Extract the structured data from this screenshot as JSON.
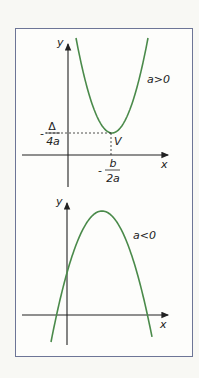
{
  "figure": {
    "curve_color": "#4a8a4a",
    "axis_color": "#222222",
    "frame_color": "#6d7596",
    "panels": [
      {
        "id": "upper",
        "case_label": "a>0",
        "axis_x_label": "x",
        "axis_y_label": "y",
        "vertex_label": "V",
        "vertex_x_label": {
          "sign": "-",
          "numerator": "b",
          "denominator": "2a"
        },
        "vertex_y_label": {
          "sign": "-",
          "numerator": "Δ",
          "denominator": "4a"
        },
        "opens": "up"
      },
      {
        "id": "lower",
        "case_label": "a<0",
        "axis_x_label": "x",
        "axis_y_label": "y",
        "opens": "down"
      }
    ]
  }
}
